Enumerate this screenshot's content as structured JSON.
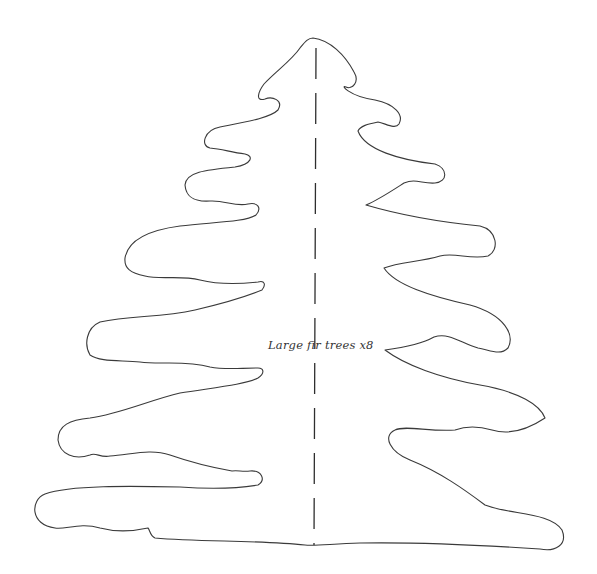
{
  "template": {
    "title": "Large fir tree cut-out template",
    "label": "Large fir trees x8",
    "fold_line": "dashed-center-line",
    "colors": {
      "outline": "#3a3a3a",
      "background": "#ffffff",
      "text": "#333333"
    }
  }
}
